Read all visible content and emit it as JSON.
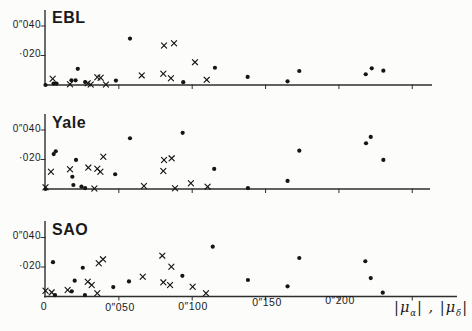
{
  "figure": {
    "background": "#fcfcfa",
    "ink_color": "#151515",
    "axis_color": "#2e2e2e"
  },
  "legend": {
    "part1": "|μ",
    "sub1": "α",
    "part2": "| , |μ",
    "sub2": "δ",
    "part3": "|"
  },
  "chart_data": {
    "type": "scatter",
    "xlabel": "|μα| , |μδ|",
    "ylabel": "",
    "xlim": [
      0,
      0.26
    ],
    "ylim": [
      0,
      0.051
    ],
    "grid": false,
    "x_unit": "arcsec",
    "x_ticks": [
      0.05,
      0.1,
      0.15,
      0.2,
      0.25
    ],
    "x_tick_labels": [
      "0",
      "0″050",
      "0″100",
      "0″150",
      "0″200"
    ],
    "x_tick_label_values": [
      0,
      0.05,
      0.1,
      0.15,
      0.2
    ],
    "y_ticks": [
      0.04,
      0.02
    ],
    "y_tick_labels": [
      "0″040",
      "·020"
    ],
    "marker_styles": [
      {
        "series": "dots",
        "marker": "circle"
      },
      {
        "series": "crosses",
        "marker": "x"
      }
    ],
    "panels": [
      {
        "title": "EBL",
        "series": [
          {
            "name": "dots",
            "marker": "circle",
            "points": [
              [
                0.0,
                0.0
              ],
              [
                0.0055,
                0.001
              ],
              [
                0.0075,
                0.001
              ],
              [
                0.0177,
                0.0032
              ],
              [
                0.0205,
                0.0032
              ],
              [
                0.022,
                0.011
              ],
              [
                0.027,
                0.002
              ],
              [
                0.048,
                0.003
              ],
              [
                0.0576,
                0.0315
              ],
              [
                0.0939,
                0.0019
              ],
              [
                0.1155,
                0.0117
              ],
              [
                0.1378,
                0.0055
              ],
              [
                0.165,
                0.0025
              ],
              [
                0.173,
                0.0095
              ],
              [
                0.2183,
                0.0073
              ],
              [
                0.2224,
                0.0113
              ],
              [
                0.2303,
                0.0097
              ]
            ]
          },
          {
            "name": "crosses",
            "marker": "x",
            "points": [
              [
                0.0049,
                0.0042
              ],
              [
                0.0167,
                0.0005
              ],
              [
                0.0288,
                0.0012
              ],
              [
                0.0308,
                0.0003
              ],
              [
                0.0353,
                0.0053
              ],
              [
                0.0376,
                0.0049
              ],
              [
                0.0412,
                0.0003
              ],
              [
                0.0656,
                0.0065
              ],
              [
                0.0803,
                0.0076
              ],
              [
                0.0808,
                0.0268
              ],
              [
                0.0855,
                0.0046
              ],
              [
                0.0876,
                0.0283
              ],
              [
                0.1019,
                0.0155
              ],
              [
                0.1099,
                0.0035
              ]
            ]
          }
        ]
      },
      {
        "title": "Yale",
        "series": [
          {
            "name": "dots",
            "marker": "circle",
            "points": [
              [
                0.0,
                0.0
              ],
              [
                0.0056,
                0.0237
              ],
              [
                0.007,
                0.0256
              ],
              [
                0.0183,
                0.0083
              ],
              [
                0.019,
                0.0027
              ],
              [
                0.0208,
                0.0197
              ],
              [
                0.0245,
                0.0016
              ],
              [
                0.027,
                0.0006
              ],
              [
                0.0475,
                0.01
              ],
              [
                0.0576,
                0.0344
              ],
              [
                0.0935,
                0.0381
              ],
              [
                0.115,
                0.0136
              ],
              [
                0.138,
                0.0006
              ],
              [
                0.165,
                0.0055
              ],
              [
                0.173,
                0.026
              ],
              [
                0.2185,
                0.031
              ],
              [
                0.2217,
                0.0353
              ],
              [
                0.2303,
                0.0197
              ]
            ]
          },
          {
            "name": "crosses",
            "marker": "x",
            "points": [
              [
                0.0,
                0.0012
              ],
              [
                0.0037,
                0.0117
              ],
              [
                0.0167,
                0.0134
              ],
              [
                0.0292,
                0.0145
              ],
              [
                0.0333,
                0.0003
              ],
              [
                0.0353,
                0.0137
              ],
              [
                0.0374,
                0.0117
              ],
              [
                0.0394,
                0.0219
              ],
              [
                0.0671,
                0.002
              ],
              [
                0.0803,
                0.0122
              ],
              [
                0.0808,
                0.0197
              ],
              [
                0.086,
                0.0208
              ],
              [
                0.0883,
                0.0005
              ],
              [
                0.0991,
                0.0039
              ],
              [
                0.1105,
                0.0016
              ]
            ]
          }
        ]
      },
      {
        "title": "SAO",
        "series": [
          {
            "name": "dots",
            "marker": "circle",
            "points": [
              [
                0.0051,
                0.0233
              ],
              [
                0.0065,
                0.001
              ],
              [
                0.0179,
                0.0035
              ],
              [
                0.0199,
                0.0107
              ],
              [
                0.0254,
                0.0195
              ],
              [
                0.0269,
                0.001
              ],
              [
                0.0462,
                0.0064
              ],
              [
                0.0569,
                0.0102
              ],
              [
                0.0933,
                0.014
              ],
              [
                0.114,
                0.0338
              ],
              [
                0.138,
                0.0112
              ],
              [
                0.165,
                0.0069
              ],
              [
                0.173,
                0.0261
              ],
              [
                0.218,
                0.0239
              ],
              [
                0.2217,
                0.0125
              ],
              [
                0.2299,
                0.0026
              ]
            ]
          },
          {
            "name": "crosses",
            "marker": "x",
            "points": [
              [
                0.0,
                0.0039
              ],
              [
                0.0042,
                0.0028
              ],
              [
                0.0151,
                0.0044
              ],
              [
                0.0288,
                0.01
              ],
              [
                0.0315,
                0.0078
              ],
              [
                0.0353,
                0.0022
              ],
              [
                0.0363,
                0.0225
              ],
              [
                0.0392,
                0.0252
              ],
              [
                0.0663,
                0.0134
              ],
              [
                0.0796,
                0.0277
              ],
              [
                0.0803,
                0.0096
              ],
              [
                0.0849,
                0.0078
              ],
              [
                0.0858,
                0.0202
              ],
              [
                0.1003,
                0.0066
              ],
              [
                0.1094,
                0.0022
              ]
            ]
          }
        ]
      }
    ]
  }
}
